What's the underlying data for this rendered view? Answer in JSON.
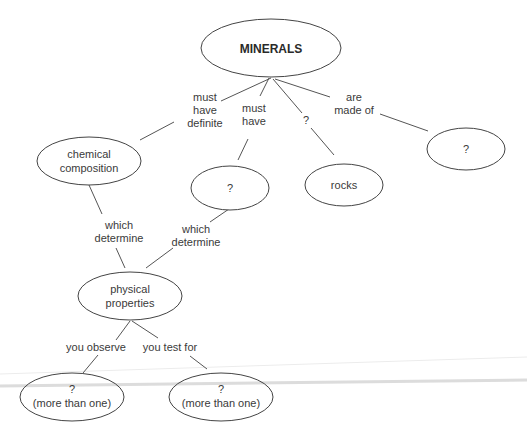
{
  "diagram": {
    "type": "concept-map",
    "colors": {
      "background": "#ffffff",
      "stroke": "#444444",
      "text": "#3a3a3a"
    },
    "nodes": {
      "minerals": {
        "lines": [
          "MINERALS"
        ]
      },
      "chemical_composition": {
        "lines": [
          "chemical",
          "composition"
        ]
      },
      "unknown_must_have": {
        "lines": [
          "?"
        ]
      },
      "rocks": {
        "lines": [
          "rocks"
        ]
      },
      "unknown_made_of": {
        "lines": [
          "?"
        ]
      },
      "physical_properties": {
        "lines": [
          "physical",
          "properties"
        ]
      },
      "observed_properties": {
        "lines": [
          "?",
          "(more than one)"
        ]
      },
      "tested_properties": {
        "lines": [
          "?",
          "(more than one)"
        ]
      }
    },
    "links": {
      "must_have_definite": {
        "lines": [
          "must",
          "have",
          "definite"
        ]
      },
      "must_have": {
        "lines": [
          "must",
          "have"
        ]
      },
      "unknown_link": {
        "lines": [
          "?"
        ]
      },
      "are_made_of": {
        "lines": [
          "are",
          "made of"
        ]
      },
      "which_determine_left": {
        "lines": [
          "which",
          "determine"
        ]
      },
      "which_determine_right": {
        "lines": [
          "which",
          "determine"
        ]
      },
      "you_observe": {
        "lines": [
          "you observe"
        ]
      },
      "you_test_for": {
        "lines": [
          "you test for"
        ]
      }
    }
  }
}
